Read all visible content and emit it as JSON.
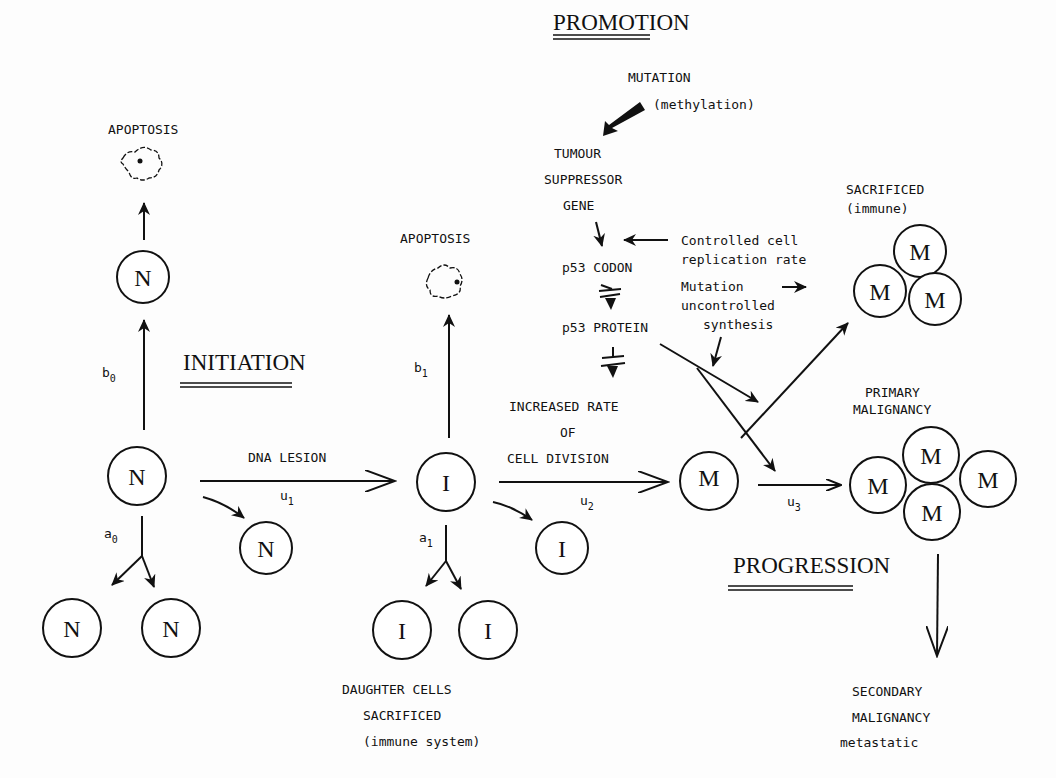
{
  "stages": {
    "initiation": "INITIATION",
    "promotion": "PROMOTION",
    "progression": "PROGRESSION"
  },
  "cells": {
    "normal": "N",
    "initiated": "I",
    "malignant": "M"
  },
  "labels": {
    "apoptosis_left": "APOPTOSIS",
    "apoptosis_mid": "APOPTOSIS",
    "dna_lesion": "DNA LESION",
    "increased_rate": [
      "INCREASED RATE",
      "OF",
      "CELL DIVISION"
    ],
    "daughter_cells": [
      "DAUGHTER CELLS",
      "SACRIFICED",
      "(immune system)"
    ],
    "mutation": "MUTATION",
    "methylation": "(methylation)",
    "tumour_suppressor": [
      "TUMOUR",
      "SUPPRESSOR",
      "GENE"
    ],
    "p53_codon": "p53 CODON",
    "p53_protein": "p53 PROTEIN",
    "controlled_rate": [
      "Controlled cell",
      "replication rate"
    ],
    "mutation_uncontrolled": [
      "Mutation",
      "uncontrolled",
      "synthesis"
    ],
    "sacrificed_immune": [
      "SACRIFICED",
      "(immune)"
    ],
    "primary_malignancy": [
      "PRIMARY",
      "MALIGNANCY"
    ],
    "secondary_malignancy": [
      "SECONDARY",
      "MALIGNANCY",
      "metastatic"
    ]
  },
  "rates": {
    "b0": {
      "base": "b",
      "sub": "0"
    },
    "a0": {
      "base": "a",
      "sub": "0"
    },
    "u1": {
      "base": "u",
      "sub": "1"
    },
    "b1": {
      "base": "b",
      "sub": "1"
    },
    "a1": {
      "base": "a",
      "sub": "1"
    },
    "u2": {
      "base": "u",
      "sub": "2"
    },
    "u3": {
      "base": "u",
      "sub": "3"
    }
  },
  "colors": {
    "ink": "#111111",
    "paper": "#fdfdfd"
  }
}
